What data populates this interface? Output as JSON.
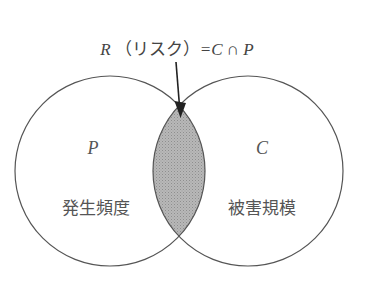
{
  "title": {
    "R": "R",
    "katakana": "（リスク）",
    "equation": "=C ∩ P",
    "full": "R（リスク）=C ∩ P"
  },
  "sets": [
    {
      "symbol": "P",
      "label": "発生頻度"
    },
    {
      "symbol": "C",
      "label": "被害規模"
    }
  ],
  "intersection": {
    "name": "R",
    "fill_color": "#b3b3b3"
  },
  "colors": {
    "stroke": "#555555",
    "text": "#555555",
    "arrow": "#222222"
  }
}
